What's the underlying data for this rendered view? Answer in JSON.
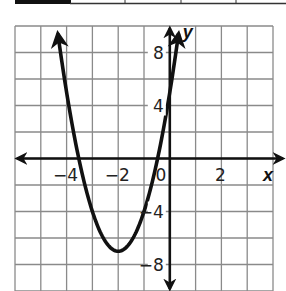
{
  "chart_data": {
    "type": "line",
    "title": "",
    "xlabel": "x",
    "ylabel": "y",
    "function": "y = 3x^2 + 12x + 5",
    "vertex": [
      -2,
      -7
    ],
    "x_intercepts": [
      -3.53,
      -0.47
    ],
    "y_intercept": 5,
    "xlim": [
      -6,
      4
    ],
    "ylim": [
      -10,
      10
    ],
    "x_grid_step": 1,
    "y_grid_step": 2,
    "grid": true,
    "x_ticks": [
      {
        "value": -4,
        "label": "−4"
      },
      {
        "value": -2,
        "label": "−2"
      },
      {
        "value": 0,
        "label": "0"
      },
      {
        "value": 2,
        "label": "2"
      }
    ],
    "y_ticks": [
      {
        "value": 8,
        "label": "8"
      },
      {
        "value": 4,
        "label": "4"
      },
      {
        "value": -4,
        "label": "−4"
      },
      {
        "value": -8,
        "label": "−8"
      }
    ],
    "series": [
      {
        "name": "parabola",
        "a": 3,
        "b": 12,
        "c": 5,
        "arrows_both_ends": true
      }
    ]
  },
  "colors": {
    "grid": "#8a8a8a",
    "axis": "#111111",
    "curve": "#111111"
  }
}
